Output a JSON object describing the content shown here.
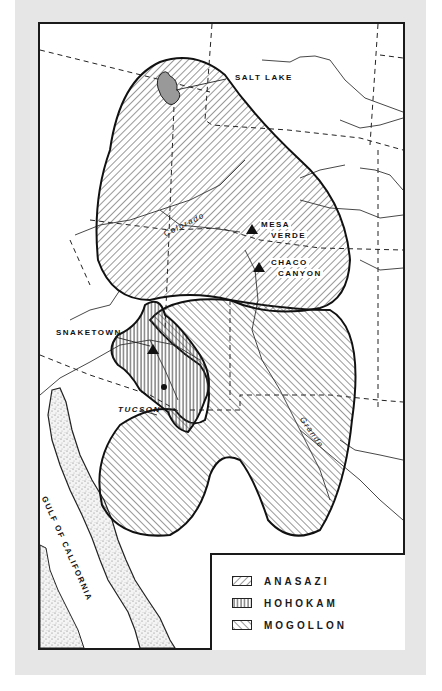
{
  "map": {
    "type": "Prehistoric cultures of the American Southwest",
    "colors": {
      "background": "#e6e6e6",
      "ink": "#1a1a1a",
      "paper": "#ffffff"
    }
  },
  "labels": {
    "salt_lake": "SALT LAKE",
    "mesa_verde_1": "MESA",
    "mesa_verde_2": "VERDE",
    "chaco_canyon_1": "CHACO",
    "chaco_canyon_2": "CANYON",
    "snaketown": "SNAKETOWN",
    "tucson": "TUCSON",
    "colorado_river": "Colorado",
    "rio_grande": "Grande",
    "gulf_of_california": "GULF OF CALIFORNIA"
  },
  "sites": [
    {
      "name": "Mesa Verde",
      "symbol": "triangle"
    },
    {
      "name": "Chaco Canyon",
      "symbol": "triangle"
    },
    {
      "name": "Snaketown",
      "symbol": "triangle"
    },
    {
      "name": "Tucson",
      "symbol": "dot"
    }
  ],
  "legend": {
    "items": [
      {
        "label": "ANASAZI",
        "pattern": "diagonal-forward"
      },
      {
        "label": "HOHOKAM",
        "pattern": "vertical"
      },
      {
        "label": "MOGOLLON",
        "pattern": "diagonal-backward"
      }
    ]
  }
}
